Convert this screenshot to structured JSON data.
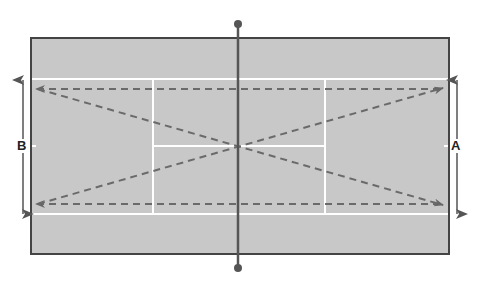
{
  "diagram": {
    "labels": {
      "left": "B",
      "right": "A"
    },
    "colors": {
      "court": "#c8c8c8",
      "border": "#444444",
      "lines": "#ffffff",
      "net": "#555555",
      "arrows": "#555555",
      "dashes": "#6a6a6a"
    },
    "elements": [
      "court-surface",
      "net-with-posts",
      "singles-and-service-lines",
      "dashed-shot-paths",
      "width-arrow-A",
      "width-arrow-B"
    ]
  }
}
